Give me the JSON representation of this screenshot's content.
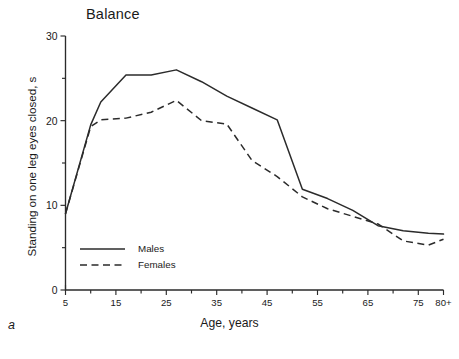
{
  "figure": {
    "title": "Balance",
    "panel_label": "a"
  },
  "chart_data": {
    "type": "line",
    "title": "Balance",
    "xlabel": "Age, years",
    "ylabel": "Standing on one leg eyes closed, s",
    "xlim": [
      5,
      80
    ],
    "ylim": [
      0,
      30
    ],
    "grid": false,
    "legend_position": "bottom-left",
    "x_tick_labels": [
      "5",
      "15",
      "25",
      "35",
      "45",
      "55",
      "65",
      "75",
      "80+"
    ],
    "x_tick_values": [
      5,
      15,
      25,
      35,
      45,
      55,
      65,
      75,
      80
    ],
    "x_minor_ticks": [
      10,
      20,
      30,
      40,
      50,
      60,
      70
    ],
    "y_tick_labels": [
      "0",
      "10",
      "20",
      "30"
    ],
    "y_tick_values": [
      0,
      10,
      20,
      30
    ],
    "y_minor_ticks": [
      5,
      15,
      25
    ],
    "x": [
      5,
      10,
      12,
      17,
      22,
      27,
      32,
      37,
      42,
      47,
      52,
      57,
      62,
      67,
      72,
      77,
      80
    ],
    "series": [
      {
        "name": "Males",
        "style": "solid",
        "values": [
          9.0,
          19.5,
          22.2,
          25.4,
          25.4,
          26.0,
          24.6,
          22.9,
          21.5,
          20.1,
          11.9,
          10.8,
          9.4,
          7.6,
          7.0,
          6.7,
          6.6
        ]
      },
      {
        "name": "Females",
        "style": "dashed",
        "values": [
          9.0,
          19.3,
          20.1,
          20.3,
          21.0,
          22.4,
          20.0,
          19.6,
          15.3,
          13.4,
          11.0,
          9.6,
          8.7,
          7.8,
          5.8,
          5.3,
          6.0
        ]
      }
    ]
  },
  "legend": {
    "items": [
      {
        "label": "Males",
        "style": "solid"
      },
      {
        "label": "Females",
        "style": "dashed"
      }
    ]
  },
  "colors": {
    "ink": "#2b2b2b",
    "background": "#ffffff"
  }
}
